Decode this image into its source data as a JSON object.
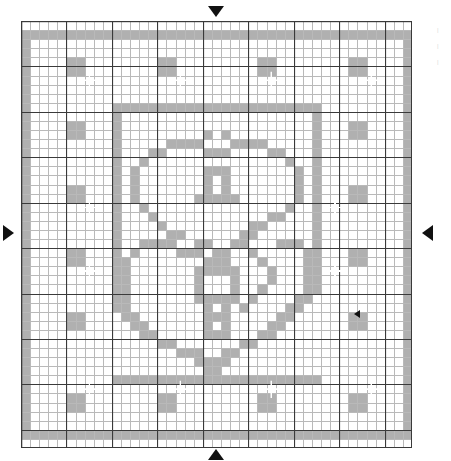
{
  "document": {
    "type": "filet-crochet-chart",
    "title": "Heart Filet Crochet Pattern Chart"
  },
  "grid": {
    "columns": 43,
    "rows": 47,
    "cell_size_px": 9.093,
    "origin_x_px": 21,
    "origin_y_px": 21,
    "width_px": 391,
    "height_px": 427,
    "minor_line_color": "#b9b9b9",
    "major_line_color": "#3a3a3a",
    "major_line_every": 5,
    "background_color": "#ffffff",
    "filled_cell_color": "#b0b0b0",
    "sparkle_color": "#ffffff"
  },
  "markers": {
    "top": {
      "name": "center-marker-top",
      "glyph": "triangle-down",
      "color": "#111111"
    },
    "bottom": {
      "name": "center-marker-bottom",
      "glyph": "triangle-up",
      "color": "#111111"
    },
    "left": {
      "name": "center-marker-left",
      "glyph": "triangle-right",
      "color": "#111111"
    },
    "right": {
      "name": "center-marker-right",
      "glyph": "triangle-left",
      "color": "#111111"
    },
    "inner_right": {
      "name": "inner-marker-right",
      "glyph": "triangle-left-small",
      "color": "#111111"
    }
  },
  "margin_notes": [
    "|",
    "|",
    "|"
  ],
  "chart_data": {
    "type": "heatmap",
    "xlabel": "",
    "ylabel": "",
    "grid": true,
    "legend": "none",
    "cols": 43,
    "rows": 47,
    "xlim": [
      0,
      43
    ],
    "ylim": [
      0,
      47
    ],
    "value_map": {
      "0": "open mesh (white)",
      "1": "filled block (grey)"
    },
    "filled_runs": [
      {
        "row": 1,
        "spans": [
          [
            0,
            43
          ]
        ]
      },
      {
        "row": 2,
        "spans": [
          [
            0,
            1
          ],
          [
            42,
            43
          ]
        ]
      },
      {
        "row": 3,
        "spans": [
          [
            0,
            1
          ],
          [
            42,
            43
          ]
        ]
      },
      {
        "row": 4,
        "spans": [
          [
            0,
            1
          ],
          [
            5,
            7
          ],
          [
            15,
            17
          ],
          [
            26,
            28
          ],
          [
            36,
            38
          ],
          [
            42,
            43
          ]
        ]
      },
      {
        "row": 5,
        "spans": [
          [
            0,
            1
          ],
          [
            5,
            7
          ],
          [
            15,
            17
          ],
          [
            26,
            28
          ],
          [
            36,
            38
          ],
          [
            42,
            43
          ]
        ]
      },
      {
        "row": 6,
        "spans": [
          [
            0,
            1
          ],
          [
            42,
            43
          ]
        ]
      },
      {
        "row": 7,
        "spans": [
          [
            0,
            1
          ],
          [
            42,
            43
          ]
        ]
      },
      {
        "row": 8,
        "spans": [
          [
            0,
            1
          ],
          [
            42,
            43
          ]
        ]
      },
      {
        "row": 9,
        "spans": [
          [
            0,
            1
          ],
          [
            10,
            33
          ],
          [
            42,
            43
          ]
        ]
      },
      {
        "row": 10,
        "spans": [
          [
            0,
            1
          ],
          [
            10,
            11
          ],
          [
            32,
            33
          ],
          [
            42,
            43
          ]
        ]
      },
      {
        "row": 11,
        "spans": [
          [
            0,
            1
          ],
          [
            5,
            7
          ],
          [
            10,
            11
          ],
          [
            32,
            33
          ],
          [
            36,
            38
          ],
          [
            42,
            43
          ]
        ]
      },
      {
        "row": 12,
        "spans": [
          [
            0,
            1
          ],
          [
            5,
            7
          ],
          [
            10,
            11
          ],
          [
            20,
            21
          ],
          [
            22,
            23
          ],
          [
            32,
            33
          ],
          [
            36,
            38
          ],
          [
            42,
            43
          ]
        ]
      },
      {
        "row": 13,
        "spans": [
          [
            0,
            1
          ],
          [
            10,
            11
          ],
          [
            16,
            20
          ],
          [
            23,
            27
          ],
          [
            32,
            33
          ],
          [
            42,
            43
          ]
        ]
      },
      {
        "row": 14,
        "spans": [
          [
            0,
            1
          ],
          [
            10,
            11
          ],
          [
            14,
            16
          ],
          [
            20,
            23
          ],
          [
            27,
            29
          ],
          [
            32,
            33
          ],
          [
            42,
            43
          ]
        ]
      },
      {
        "row": 15,
        "spans": [
          [
            0,
            1
          ],
          [
            10,
            11
          ],
          [
            13,
            14
          ],
          [
            29,
            30
          ],
          [
            32,
            33
          ],
          [
            42,
            43
          ]
        ]
      },
      {
        "row": 16,
        "spans": [
          [
            0,
            1
          ],
          [
            10,
            11
          ],
          [
            12,
            13
          ],
          [
            20,
            23
          ],
          [
            30,
            31
          ],
          [
            32,
            33
          ],
          [
            42,
            43
          ]
        ]
      },
      {
        "row": 17,
        "spans": [
          [
            0,
            1
          ],
          [
            10,
            11
          ],
          [
            12,
            13
          ],
          [
            20,
            21
          ],
          [
            22,
            23
          ],
          [
            30,
            31
          ],
          [
            32,
            33
          ],
          [
            42,
            43
          ]
        ]
      },
      {
        "row": 18,
        "spans": [
          [
            0,
            1
          ],
          [
            5,
            7
          ],
          [
            10,
            11
          ],
          [
            12,
            13
          ],
          [
            20,
            21
          ],
          [
            22,
            23
          ],
          [
            30,
            31
          ],
          [
            32,
            33
          ],
          [
            36,
            38
          ],
          [
            42,
            43
          ]
        ]
      },
      {
        "row": 19,
        "spans": [
          [
            0,
            1
          ],
          [
            5,
            7
          ],
          [
            10,
            11
          ],
          [
            12,
            13
          ],
          [
            19,
            24
          ],
          [
            30,
            31
          ],
          [
            32,
            33
          ],
          [
            36,
            38
          ],
          [
            42,
            43
          ]
        ]
      },
      {
        "row": 20,
        "spans": [
          [
            0,
            1
          ],
          [
            10,
            11
          ],
          [
            13,
            14
          ],
          [
            29,
            30
          ],
          [
            32,
            33
          ],
          [
            42,
            43
          ]
        ]
      },
      {
        "row": 21,
        "spans": [
          [
            0,
            1
          ],
          [
            10,
            11
          ],
          [
            14,
            15
          ],
          [
            27,
            29
          ],
          [
            32,
            33
          ],
          [
            42,
            43
          ]
        ]
      },
      {
        "row": 22,
        "spans": [
          [
            0,
            1
          ],
          [
            10,
            11
          ],
          [
            15,
            16
          ],
          [
            25,
            27
          ],
          [
            32,
            33
          ],
          [
            42,
            43
          ]
        ]
      },
      {
        "row": 23,
        "spans": [
          [
            0,
            1
          ],
          [
            10,
            11
          ],
          [
            16,
            18
          ],
          [
            24,
            26
          ],
          [
            32,
            33
          ],
          [
            42,
            43
          ]
        ]
      },
      {
        "row": 24,
        "spans": [
          [
            0,
            1
          ],
          [
            10,
            11
          ],
          [
            13,
            17
          ],
          [
            19,
            21
          ],
          [
            23,
            25
          ],
          [
            28,
            31
          ],
          [
            32,
            33
          ],
          [
            42,
            43
          ]
        ]
      },
      {
        "row": 25,
        "spans": [
          [
            0,
            1
          ],
          [
            5,
            7
          ],
          [
            10,
            11
          ],
          [
            12,
            13
          ],
          [
            17,
            20
          ],
          [
            21,
            23
          ],
          [
            25,
            26
          ],
          [
            31,
            32
          ],
          [
            32,
            33
          ],
          [
            36,
            38
          ],
          [
            42,
            43
          ]
        ]
      },
      {
        "row": 26,
        "spans": [
          [
            0,
            1
          ],
          [
            5,
            7
          ],
          [
            10,
            11
          ],
          [
            11,
            12
          ],
          [
            20,
            23
          ],
          [
            26,
            27
          ],
          [
            31,
            32
          ],
          [
            32,
            33
          ],
          [
            36,
            38
          ],
          [
            42,
            43
          ]
        ]
      },
      {
        "row": 27,
        "spans": [
          [
            0,
            1
          ],
          [
            10,
            12
          ],
          [
            19,
            24
          ],
          [
            27,
            28
          ],
          [
            31,
            33
          ],
          [
            42,
            43
          ]
        ]
      },
      {
        "row": 28,
        "spans": [
          [
            0,
            1
          ],
          [
            10,
            12
          ],
          [
            19,
            20
          ],
          [
            23,
            24
          ],
          [
            27,
            28
          ],
          [
            31,
            33
          ],
          [
            42,
            43
          ]
        ]
      },
      {
        "row": 29,
        "spans": [
          [
            0,
            1
          ],
          [
            10,
            12
          ],
          [
            19,
            20
          ],
          [
            23,
            24
          ],
          [
            26,
            27
          ],
          [
            31,
            33
          ],
          [
            42,
            43
          ]
        ]
      },
      {
        "row": 30,
        "spans": [
          [
            0,
            1
          ],
          [
            10,
            12
          ],
          [
            19,
            24
          ],
          [
            25,
            26
          ],
          [
            30,
            32
          ],
          [
            42,
            43
          ]
        ]
      },
      {
        "row": 31,
        "spans": [
          [
            0,
            1
          ],
          [
            10,
            12
          ],
          [
            20,
            21
          ],
          [
            22,
            23
          ],
          [
            24,
            25
          ],
          [
            29,
            31
          ],
          [
            42,
            43
          ]
        ]
      },
      {
        "row": 32,
        "spans": [
          [
            0,
            1
          ],
          [
            5,
            7
          ],
          [
            11,
            13
          ],
          [
            20,
            23
          ],
          [
            28,
            30
          ],
          [
            36,
            38
          ],
          [
            42,
            43
          ]
        ]
      },
      {
        "row": 33,
        "spans": [
          [
            0,
            1
          ],
          [
            5,
            7
          ],
          [
            12,
            14
          ],
          [
            20,
            21
          ],
          [
            22,
            23
          ],
          [
            27,
            29
          ],
          [
            36,
            38
          ],
          [
            42,
            43
          ]
        ]
      },
      {
        "row": 34,
        "spans": [
          [
            0,
            1
          ],
          [
            13,
            15
          ],
          [
            20,
            23
          ],
          [
            26,
            28
          ],
          [
            42,
            43
          ]
        ]
      },
      {
        "row": 35,
        "spans": [
          [
            0,
            1
          ],
          [
            15,
            17
          ],
          [
            24,
            26
          ],
          [
            42,
            43
          ]
        ]
      },
      {
        "row": 36,
        "spans": [
          [
            0,
            1
          ],
          [
            17,
            20
          ],
          [
            22,
            24
          ],
          [
            42,
            43
          ]
        ]
      },
      {
        "row": 37,
        "spans": [
          [
            0,
            1
          ],
          [
            19,
            23
          ],
          [
            42,
            43
          ]
        ]
      },
      {
        "row": 38,
        "spans": [
          [
            0,
            1
          ],
          [
            20,
            22
          ],
          [
            42,
            43
          ]
        ]
      },
      {
        "row": 39,
        "spans": [
          [
            0,
            1
          ],
          [
            10,
            33
          ],
          [
            42,
            43
          ]
        ]
      },
      {
        "row": 40,
        "spans": [
          [
            0,
            1
          ],
          [
            42,
            43
          ]
        ]
      },
      {
        "row": 41,
        "spans": [
          [
            0,
            1
          ],
          [
            5,
            7
          ],
          [
            15,
            17
          ],
          [
            26,
            28
          ],
          [
            36,
            38
          ],
          [
            42,
            43
          ]
        ]
      },
      {
        "row": 42,
        "spans": [
          [
            0,
            1
          ],
          [
            5,
            7
          ],
          [
            15,
            17
          ],
          [
            26,
            28
          ],
          [
            36,
            38
          ],
          [
            42,
            43
          ]
        ]
      },
      {
        "row": 43,
        "spans": [
          [
            0,
            1
          ],
          [
            42,
            43
          ]
        ]
      },
      {
        "row": 44,
        "spans": [
          [
            0,
            1
          ],
          [
            42,
            43
          ]
        ]
      },
      {
        "row": 45,
        "spans": [
          [
            0,
            43
          ]
        ]
      }
    ],
    "sparkles": [
      [
        7,
        6
      ],
      [
        17,
        6
      ],
      [
        27,
        6
      ],
      [
        38,
        6
      ],
      [
        7,
        20
      ],
      [
        34,
        20
      ],
      [
        7,
        27
      ],
      [
        34,
        27
      ],
      [
        7,
        40
      ],
      [
        17,
        40
      ],
      [
        27,
        40
      ],
      [
        38,
        40
      ]
    ]
  }
}
